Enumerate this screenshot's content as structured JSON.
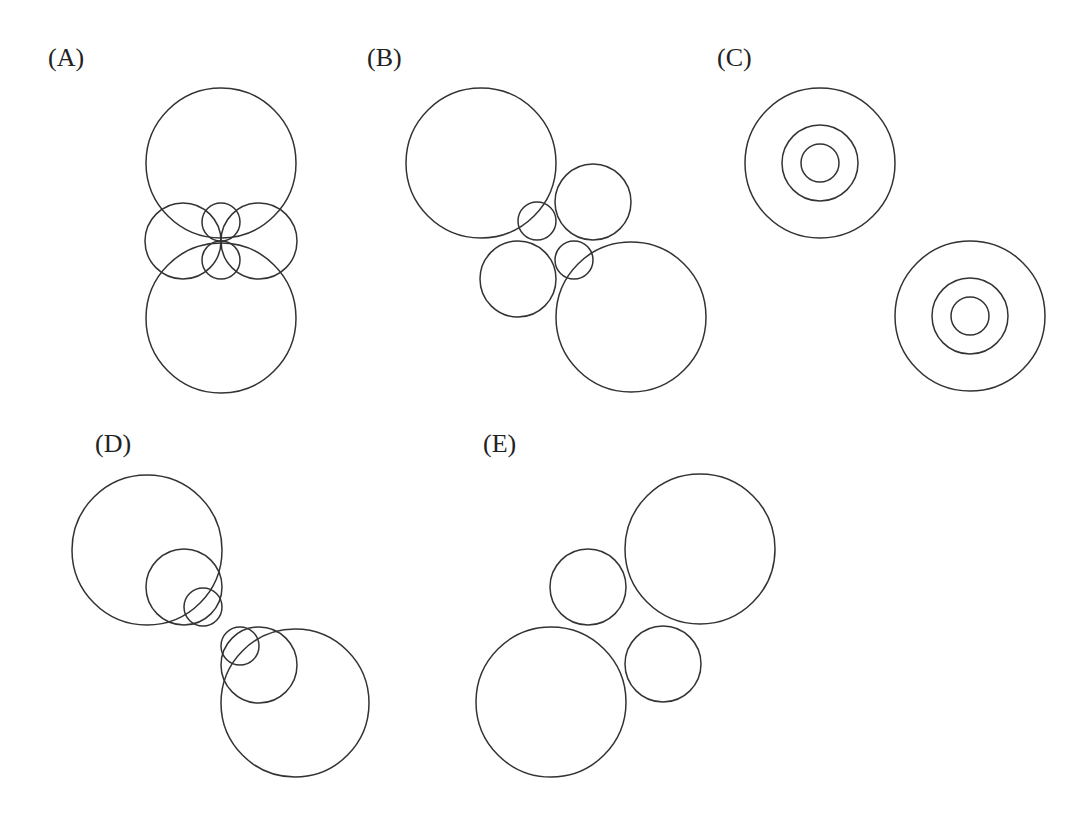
{
  "figure": {
    "stroke_color": "#333333",
    "background": "#ffffff",
    "panels": [
      {
        "id": "A",
        "label": "(A)",
        "label_pos": [
          48,
          66
        ],
        "circles": [
          {
            "cx": 221,
            "cy": 163,
            "r": 75
          },
          {
            "cx": 221,
            "cy": 318,
            "r": 75
          },
          {
            "cx": 183,
            "cy": 241,
            "r": 38
          },
          {
            "cx": 259,
            "cy": 241,
            "r": 38
          },
          {
            "cx": 221,
            "cy": 222,
            "r": 19
          },
          {
            "cx": 221,
            "cy": 260,
            "r": 19
          }
        ]
      },
      {
        "id": "B",
        "label": "(B)",
        "label_pos": [
          367,
          66
        ],
        "circles": [
          {
            "cx": 481,
            "cy": 163,
            "r": 75
          },
          {
            "cx": 631,
            "cy": 317,
            "r": 75
          },
          {
            "cx": 593,
            "cy": 202,
            "r": 38
          },
          {
            "cx": 518,
            "cy": 279,
            "r": 38
          },
          {
            "cx": 537,
            "cy": 221,
            "r": 19
          },
          {
            "cx": 574,
            "cy": 260,
            "r": 19
          }
        ]
      },
      {
        "id": "C",
        "label": "(C)",
        "label_pos": [
          717,
          66
        ],
        "circles": [
          {
            "cx": 820,
            "cy": 163,
            "r": 75
          },
          {
            "cx": 820,
            "cy": 163,
            "r": 38
          },
          {
            "cx": 820,
            "cy": 163,
            "r": 19
          },
          {
            "cx": 970,
            "cy": 316,
            "r": 75
          },
          {
            "cx": 970,
            "cy": 316,
            "r": 38
          },
          {
            "cx": 970,
            "cy": 316,
            "r": 19
          }
        ]
      },
      {
        "id": "D",
        "label": "(D)",
        "label_pos": [
          95,
          452
        ],
        "circles": [
          {
            "cx": 147,
            "cy": 550,
            "r": 75
          },
          {
            "cx": 184,
            "cy": 587,
            "r": 38
          },
          {
            "cx": 203,
            "cy": 607,
            "r": 19
          },
          {
            "cx": 295,
            "cy": 703,
            "r": 74
          },
          {
            "cx": 259,
            "cy": 665,
            "r": 38
          },
          {
            "cx": 240,
            "cy": 646,
            "r": 19
          }
        ]
      },
      {
        "id": "E",
        "label": "(E)",
        "label_pos": [
          483,
          452
        ],
        "circles": [
          {
            "cx": 700,
            "cy": 549,
            "r": 75
          },
          {
            "cx": 551,
            "cy": 702,
            "r": 75
          },
          {
            "cx": 588,
            "cy": 587,
            "r": 38
          },
          {
            "cx": 663,
            "cy": 664,
            "r": 38
          }
        ]
      }
    ]
  }
}
